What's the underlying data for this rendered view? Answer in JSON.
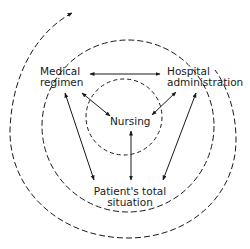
{
  "diagram": {
    "type": "concentric-spiral-relationship",
    "nodes": {
      "medical": {
        "line1": "Medical",
        "line2": "regimen"
      },
      "hospital": {
        "line1": "Hospital",
        "line2": "administration"
      },
      "nursing": {
        "label": "Nursing"
      },
      "patient": {
        "line1": "Patient's total",
        "line2": "situation"
      }
    },
    "edges": [
      {
        "from": "medical",
        "to": "hospital",
        "style": "double-arrow"
      },
      {
        "from": "medical",
        "to": "nursing",
        "style": "double-arrow"
      },
      {
        "from": "hospital",
        "to": "nursing",
        "style": "double-arrow"
      },
      {
        "from": "medical",
        "to": "patient",
        "style": "double-arrow"
      },
      {
        "from": "hospital",
        "to": "patient",
        "style": "double-arrow"
      },
      {
        "from": "nursing",
        "to": "patient",
        "style": "double-arrow"
      }
    ],
    "rings": [
      "inner-dashed-circle",
      "middle-dashed-circle",
      "outer-dashed-spiral"
    ],
    "colors": {
      "ink": "#1a1a1a",
      "background": "#ffffff"
    }
  }
}
